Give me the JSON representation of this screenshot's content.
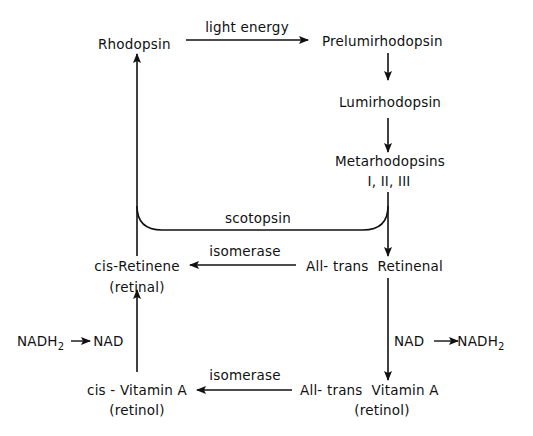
{
  "diagram": {
    "nodes": {
      "rhodopsin": "Rhodopsin",
      "prelumirhodopsin": "Prelumirhodopsin",
      "lumirhodopsin": "Lumirhodopsin",
      "metarhodopsins": "Metarhodopsins",
      "metarhodopsins_forms": "I, II, III",
      "all_trans_retinenal": "All- trans  Retinenal",
      "cis_retinene": "cis-Retinene",
      "cis_retinene_alias": "(retinal)",
      "all_trans_vitamin_a": "All- trans  Vitamin A",
      "all_trans_vitamin_a_alias": "(retinol)",
      "cis_vitamin_a": "cis - Vitamin A",
      "cis_vitamin_a_alias": "(retinol)"
    },
    "edge_labels": {
      "light_energy": "light energy",
      "scotopsin": "scotopsin",
      "isomerase_top": "isomerase",
      "isomerase_bottom": "isomerase"
    },
    "cofactors": {
      "right": {
        "from": "NAD",
        "to_base": "NADH",
        "to_sub": "2"
      },
      "left": {
        "from_base": "NADH",
        "from_sub": "2",
        "to": "NAD"
      }
    },
    "edges": [
      {
        "from": "Rhodopsin",
        "to": "Prelumirhodopsin",
        "label": "light energy"
      },
      {
        "from": "Prelumirhodopsin",
        "to": "Lumirhodopsin"
      },
      {
        "from": "Lumirhodopsin",
        "to": "Metarhodopsins I, II, III"
      },
      {
        "from": "Metarhodopsins I, II, III",
        "to": "All-trans Retinenal"
      },
      {
        "from": "Metarhodopsins I, II, III",
        "to": "Rhodopsin",
        "label": "scotopsin"
      },
      {
        "from": "All-trans Retinenal",
        "to": "cis-Retinene (retinal)",
        "label": "isomerase"
      },
      {
        "from": "All-trans Retinenal",
        "to": "All-trans Vitamin A (retinol)",
        "label": "NAD → NADH2"
      },
      {
        "from": "All-trans Vitamin A (retinol)",
        "to": "cis-Vitamin A (retinol)",
        "label": "isomerase"
      },
      {
        "from": "cis-Vitamin A (retinol)",
        "to": "cis-Retinene (retinal)",
        "label": "NADH2 → NAD"
      },
      {
        "from": "cis-Retinene (retinal)",
        "to": "Rhodopsin"
      }
    ],
    "line_color": "#111111"
  }
}
